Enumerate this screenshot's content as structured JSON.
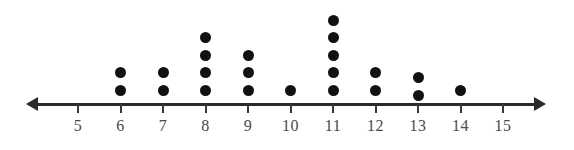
{
  "chart_data": {
    "type": "dot_plot",
    "title": "",
    "subtitle": "",
    "xlabel": "",
    "ylabel": "",
    "grid": false,
    "legend": null,
    "axis": {
      "orientation": "horizontal",
      "arrow_left": true,
      "arrow_right": true,
      "xlim": [
        4.3,
        15.7
      ],
      "tick_step": 1
    },
    "categories": [
      5,
      6,
      7,
      8,
      9,
      10,
      11,
      12,
      13,
      14,
      15
    ],
    "tick_labels": [
      "5",
      "6",
      "7",
      "8",
      "9",
      "10",
      "11",
      "12",
      "13",
      "14",
      "15"
    ],
    "values": [
      0,
      2,
      2,
      4,
      3,
      1,
      5,
      2,
      2,
      1,
      0
    ],
    "total_dots": 22,
    "dot_color": "#111111",
    "axis_color": "#2b2b2b",
    "label_color": "#4a4a4a",
    "points": [
      {
        "x": 5,
        "count": 0
      },
      {
        "x": 6,
        "count": 2
      },
      {
        "x": 7,
        "count": 2
      },
      {
        "x": 8,
        "count": 4
      },
      {
        "x": 9,
        "count": 3
      },
      {
        "x": 10,
        "count": 1
      },
      {
        "x": 11,
        "count": 5
      },
      {
        "x": 12,
        "count": 2
      },
      {
        "x": 13,
        "count": 2
      },
      {
        "x": 14,
        "count": 1
      },
      {
        "x": 15,
        "count": 0
      }
    ]
  },
  "layout": {
    "axis_y": 103,
    "origin_x": 78,
    "tick_spacing": 42.5,
    "dot_base_y": 90,
    "dot_spacing": 17.5,
    "column_offsets": {
      "13": 5
    }
  }
}
